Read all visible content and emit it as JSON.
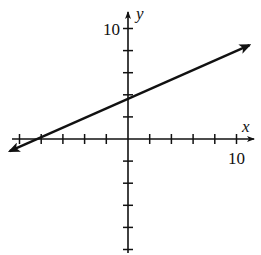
{
  "chart_data": {
    "type": "line",
    "title": "",
    "xlabel": "x",
    "ylabel": "y",
    "xlim": [
      -10,
      10
    ],
    "ylim": [
      -10,
      10
    ],
    "tick_step": 2,
    "grid": false,
    "x_tick_label": "10",
    "y_tick_label": "10",
    "series": [
      {
        "name": "line",
        "kind": "line-with-arrows",
        "points": [
          [
            -10.9,
            -1.1
          ],
          [
            -8,
            0
          ],
          [
            0,
            3.7
          ],
          [
            11.2,
            8.5
          ]
        ],
        "x_intercept": -8,
        "y_intercept": 3.7,
        "color": "#111111"
      }
    ]
  }
}
